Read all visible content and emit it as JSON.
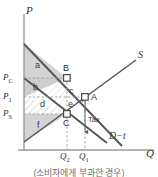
{
  "figure": {
    "caption": "(소비자에게 부과한 경우)",
    "axes": {
      "y_label": "P",
      "x_label": "Q",
      "origin": [
        24,
        150
      ]
    },
    "price_ticks": [
      {
        "id": "pc",
        "label": "P",
        "sub": "C",
        "y": 78
      },
      {
        "id": "p1",
        "label": "P",
        "sub": "1",
        "y": 97
      },
      {
        "id": "ps",
        "label": "P",
        "sub": "S",
        "y": 114
      }
    ],
    "quantity_ticks": [
      {
        "id": "q2",
        "label": "Q",
        "sub": "2",
        "x": 67
      },
      {
        "id": "q1",
        "label": "Q",
        "sub": "1",
        "x": 85
      }
    ],
    "curves": [
      {
        "id": "supply",
        "label": "S",
        "label_x": 138,
        "label_y": 56
      },
      {
        "id": "demand",
        "label": "D",
        "label_x": 0,
        "label_y": 0
      },
      {
        "id": "demand_after_tax",
        "label": "D−t",
        "label_x": 109,
        "label_y": 136
      }
    ],
    "points": [
      {
        "id": "B",
        "label": "B",
        "x": 67,
        "y": 78
      },
      {
        "id": "A",
        "label": "A",
        "x": 85,
        "y": 97
      },
      {
        "id": "C",
        "label": "C",
        "x": 67,
        "y": 114
      }
    ],
    "areas": [
      {
        "id": "a",
        "label": "a",
        "x": 37,
        "y": 66
      },
      {
        "id": "b",
        "label": "b",
        "x": 35,
        "y": 88
      },
      {
        "id": "c",
        "label": "c",
        "x": 71,
        "y": 91
      },
      {
        "id": "d",
        "label": "d",
        "x": 42,
        "y": 105
      },
      {
        "id": "e",
        "label": "e",
        "x": 70,
        "y": 104
      },
      {
        "id": "f",
        "label": "f",
        "x": 38,
        "y": 126
      }
    ],
    "annotations": [
      {
        "id": "tax",
        "label": "Tax",
        "x": 89,
        "y": 119
      }
    ],
    "colors": {
      "shade_gray": "#d2d2d2",
      "curve": "#4a4a4a",
      "dashed": "#8a8a8a",
      "axis": "#8f8f8f",
      "text": "#3a3a3a"
    }
  }
}
